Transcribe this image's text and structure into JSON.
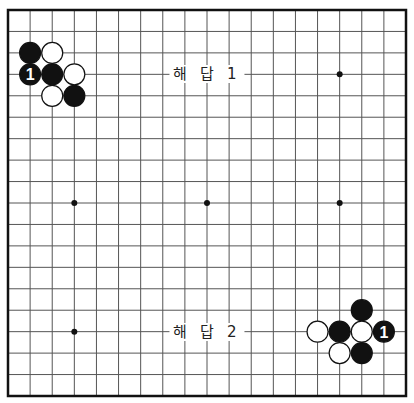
{
  "board": {
    "size": 19,
    "left": 8,
    "top": 10,
    "right": 406,
    "bottom": 396,
    "line_color": "#555555",
    "border_color": "#111111",
    "star_points": [
      [
        3,
        3
      ],
      [
        9,
        3
      ],
      [
        15,
        3
      ],
      [
        3,
        9
      ],
      [
        9,
        9
      ],
      [
        15,
        9
      ],
      [
        3,
        15
      ],
      [
        9,
        15
      ],
      [
        15,
        15
      ]
    ],
    "hidden_star_points": [
      [
        3,
        3
      ],
      [
        9,
        3
      ]
    ]
  },
  "labels": [
    {
      "text": "해 답 1",
      "col": 9,
      "row": 3
    },
    {
      "text": "해 답 2",
      "col": 9,
      "row": 15
    }
  ],
  "stones": [
    {
      "color": "black",
      "col": 1,
      "row": 2
    },
    {
      "color": "white",
      "col": 2,
      "row": 2
    },
    {
      "color": "black",
      "col": 1,
      "row": 3,
      "number": "1"
    },
    {
      "color": "black",
      "col": 2,
      "row": 3
    },
    {
      "color": "white",
      "col": 3,
      "row": 3
    },
    {
      "color": "white",
      "col": 2,
      "row": 4
    },
    {
      "color": "black",
      "col": 3,
      "row": 4
    },
    {
      "color": "black",
      "col": 16,
      "row": 14
    },
    {
      "color": "white",
      "col": 14,
      "row": 15
    },
    {
      "color": "black",
      "col": 15,
      "row": 15
    },
    {
      "color": "white",
      "col": 16,
      "row": 15
    },
    {
      "color": "black",
      "col": 17,
      "row": 15,
      "number": "1"
    },
    {
      "color": "white",
      "col": 15,
      "row": 16
    },
    {
      "color": "black",
      "col": 16,
      "row": 16
    }
  ]
}
